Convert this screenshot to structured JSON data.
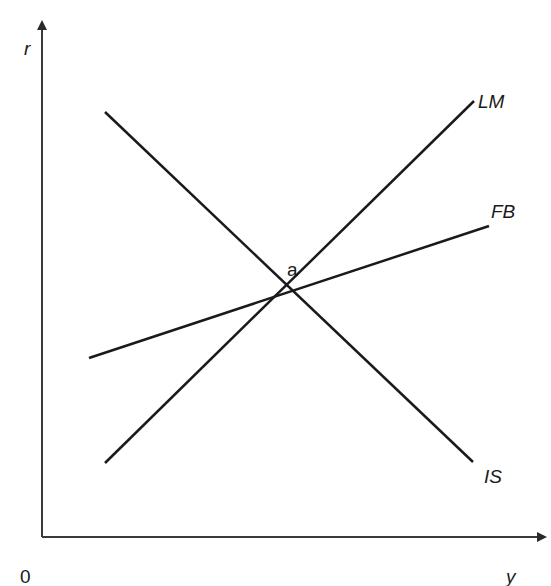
{
  "diagram": {
    "type": "IS-LM-FB",
    "axes": {
      "y_axis_label": "r",
      "x_axis_label": "y",
      "origin_label": "0"
    },
    "curves": [
      {
        "id": "LM",
        "label": "LM",
        "slope": "upward"
      },
      {
        "id": "FB",
        "label": "FB",
        "slope": "upward, flatter than LM"
      },
      {
        "id": "IS",
        "label": "IS",
        "slope": "downward"
      }
    ],
    "equilibrium": {
      "label": "a",
      "description": "intersection of IS, LM and FB"
    },
    "colors": {
      "line": "#1a1a1a",
      "background": "#ffffff"
    }
  }
}
